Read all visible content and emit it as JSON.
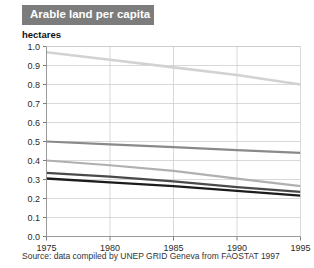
{
  "header": {
    "title": "Arable land per capita"
  },
  "axis": {
    "unit_label": "hectares"
  },
  "footer": {
    "source": "Source: data compiled by UNEP GRID Geneva from FAOSTAT 1997"
  },
  "colors": {
    "title_bar": "#7c7c7c",
    "title_text": "#ffffff",
    "grid": "#c9c9c9",
    "axis": "#8f8f8f",
    "series_light": "#d2d2d2",
    "series_mid": "#8a8a8a",
    "series_gray": "#b0b0b0",
    "series_dark": "#4a4a4a",
    "series_black": "#1c1c1c"
  },
  "chart_data": {
    "type": "line",
    "title": "Arable land per capita",
    "xlabel": "",
    "ylabel": "hectares",
    "xlim": [
      1975,
      1995
    ],
    "ylim": [
      0.0,
      1.0
    ],
    "grid": true,
    "legend": "none",
    "x": [
      1975,
      1980,
      1985,
      1990,
      1995
    ],
    "xtick_labels": [
      "1975",
      "1980",
      "1985",
      "1990",
      "1995"
    ],
    "ytick_labels": [
      "0.0",
      "0.1",
      "0.2",
      "0.3",
      "0.4",
      "0.5",
      "0.6",
      "0.7",
      "0.8",
      "0.9",
      "1.0"
    ],
    "ytick_values": [
      0.0,
      0.1,
      0.2,
      0.3,
      0.4,
      0.5,
      0.6,
      0.7,
      0.8,
      0.9,
      1.0
    ],
    "series": [
      {
        "name": "series-1",
        "color": "#d2d2d2",
        "width": 2.6,
        "values": [
          0.97,
          0.93,
          0.89,
          0.85,
          0.8
        ]
      },
      {
        "name": "series-2",
        "color": "#8a8a8a",
        "width": 2.2,
        "values": [
          0.5,
          0.485,
          0.47,
          0.455,
          0.44
        ]
      },
      {
        "name": "series-3",
        "color": "#b0b0b0",
        "width": 2.2,
        "values": [
          0.4,
          0.375,
          0.345,
          0.305,
          0.265
        ]
      },
      {
        "name": "series-4",
        "color": "#4a4a4a",
        "width": 2.2,
        "values": [
          0.335,
          0.315,
          0.29,
          0.26,
          0.235
        ]
      },
      {
        "name": "series-5",
        "color": "#1c1c1c",
        "width": 2.4,
        "values": [
          0.305,
          0.285,
          0.265,
          0.24,
          0.215
        ]
      }
    ]
  }
}
